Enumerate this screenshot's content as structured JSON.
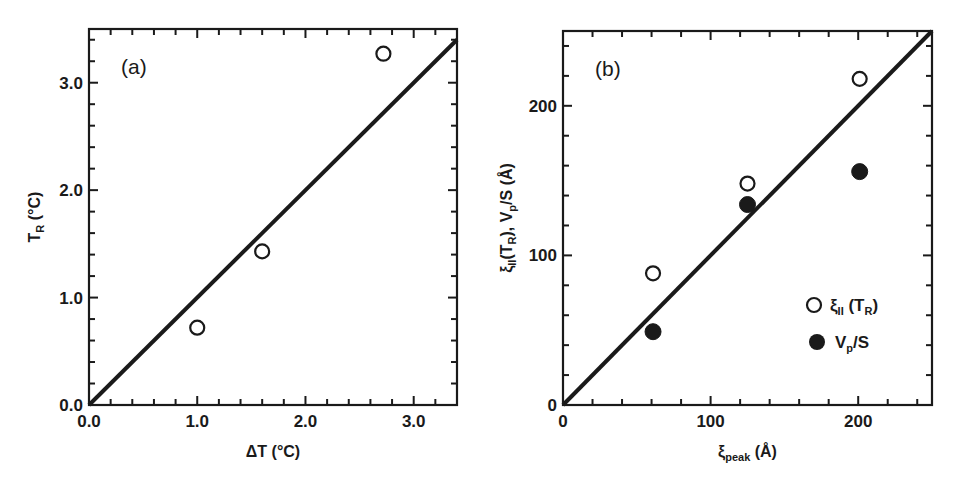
{
  "chart_data": [
    {
      "type": "scatter",
      "panel_label": "(a)",
      "title": "",
      "xlabel": "ΔT (°C)",
      "ylabel": "T_R (°C)",
      "xlabel_parts": {
        "main": "ΔT (°C)"
      },
      "ylabel_parts": {
        "main": "T",
        "sub": "R",
        "rest": " (°C)"
      },
      "xlim": [
        0,
        3.4
      ],
      "ylim": [
        0,
        3.5
      ],
      "x_ticks": [
        0.0,
        1.0,
        2.0,
        3.0
      ],
      "x_tick_labels": [
        "0.0",
        "1.0",
        "2.0",
        "3.0"
      ],
      "y_ticks": [
        0.0,
        1.0,
        2.0,
        3.0
      ],
      "y_tick_labels": [
        "0.0",
        "1.0",
        "2.0",
        "3.0"
      ],
      "minor_tick_step": 0.2,
      "grid": false,
      "legend": null,
      "series": [
        {
          "name": "T_R",
          "marker": "open-circle",
          "x": [
            1.0,
            1.6,
            2.72
          ],
          "y": [
            0.72,
            1.43,
            3.27
          ]
        }
      ],
      "reference_line": {
        "name": "y = x",
        "x": [
          0,
          3.4
        ],
        "y": [
          0,
          3.4
        ]
      }
    },
    {
      "type": "scatter",
      "panel_label": "(b)",
      "title": "",
      "xlabel": "ξ_peak (Å)",
      "ylabel": "ξ_II(T_R), V_p/S (Å)",
      "xlabel_parts": {
        "main": "ξ",
        "sub": "peak",
        "rest": " (Å)"
      },
      "ylabel_parts": {
        "p1": "ξ",
        "s1": "II",
        "p2": "(T",
        "s2": "R",
        "p3": "),  V",
        "s3": "p",
        "p4": "/S  (Å)"
      },
      "xlim": [
        0,
        250
      ],
      "ylim": [
        0,
        250
      ],
      "x_ticks": [
        0,
        100,
        200
      ],
      "x_tick_labels": [
        "0",
        "100",
        "200"
      ],
      "y_ticks": [
        0,
        100,
        200
      ],
      "y_tick_labels": [
        "0",
        "100",
        "200"
      ],
      "minor_tick_step": 20,
      "grid": false,
      "legend": {
        "position": "lower right",
        "entries": [
          {
            "marker": "open-circle",
            "label_main": "ξ",
            "label_sub": "II",
            "label_rest": " (T",
            "label_sub2": "R",
            "label_end": ")"
          },
          {
            "marker": "filled-circle",
            "label_main": "V",
            "label_sub": "p",
            "label_rest": "/S",
            "label_sub2": "",
            "label_end": ""
          }
        ]
      },
      "series": [
        {
          "name": "ξ_II (T_R)",
          "marker": "open-circle",
          "x": [
            61,
            125,
            201
          ],
          "y": [
            88,
            148,
            218
          ]
        },
        {
          "name": "V_p/S",
          "marker": "filled-circle",
          "x": [
            61,
            125,
            201
          ],
          "y": [
            49,
            134,
            156
          ]
        }
      ],
      "reference_line": {
        "name": "y = x",
        "x": [
          0,
          250
        ],
        "y": [
          0,
          250
        ]
      }
    }
  ]
}
